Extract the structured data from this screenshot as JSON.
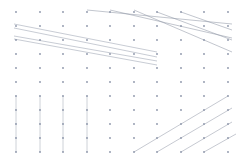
{
  "chart_data": {
    "type": "scatter",
    "title": "",
    "subtitle": "",
    "xlabel": "",
    "ylabel": "",
    "grid": false,
    "legend": null,
    "axis_visible": false,
    "background": "#ffffff",
    "point_color": "#8a93a8",
    "line_color": "#9aa1b0",
    "point_radius": 0.9,
    "line_width": 0.55,
    "xlim": [
      0,
      10
    ],
    "ylim": [
      0,
      11
    ],
    "x_tick_labels": [],
    "y_tick_labels": [],
    "lattice": {
      "columns": 10,
      "rows": 11,
      "x": [
        16,
        40,
        63,
        87,
        110,
        134,
        157,
        181,
        204,
        228
      ],
      "y": [
        12,
        26,
        40,
        54,
        68,
        82,
        96,
        110,
        124,
        138,
        152
      ]
    },
    "points": [
      {
        "x": 16,
        "y": 12
      },
      {
        "x": 40,
        "y": 12
      },
      {
        "x": 63,
        "y": 12
      },
      {
        "x": 87,
        "y": 12
      },
      {
        "x": 110,
        "y": 12
      },
      {
        "x": 134,
        "y": 12
      },
      {
        "x": 157,
        "y": 12
      },
      {
        "x": 181,
        "y": 12
      },
      {
        "x": 204,
        "y": 12
      },
      {
        "x": 228,
        "y": 12
      },
      {
        "x": 16,
        "y": 26
      },
      {
        "x": 40,
        "y": 26
      },
      {
        "x": 63,
        "y": 26
      },
      {
        "x": 87,
        "y": 26
      },
      {
        "x": 110,
        "y": 26
      },
      {
        "x": 134,
        "y": 26
      },
      {
        "x": 157,
        "y": 26
      },
      {
        "x": 181,
        "y": 26
      },
      {
        "x": 204,
        "y": 26
      },
      {
        "x": 228,
        "y": 26
      },
      {
        "x": 16,
        "y": 40
      },
      {
        "x": 40,
        "y": 40
      },
      {
        "x": 63,
        "y": 40
      },
      {
        "x": 87,
        "y": 40
      },
      {
        "x": 110,
        "y": 40
      },
      {
        "x": 134,
        "y": 40
      },
      {
        "x": 157,
        "y": 40
      },
      {
        "x": 181,
        "y": 40
      },
      {
        "x": 204,
        "y": 40
      },
      {
        "x": 228,
        "y": 40
      },
      {
        "x": 16,
        "y": 54
      },
      {
        "x": 40,
        "y": 54
      },
      {
        "x": 63,
        "y": 54
      },
      {
        "x": 87,
        "y": 54
      },
      {
        "x": 110,
        "y": 54
      },
      {
        "x": 134,
        "y": 54
      },
      {
        "x": 157,
        "y": 54
      },
      {
        "x": 181,
        "y": 54
      },
      {
        "x": 204,
        "y": 54
      },
      {
        "x": 228,
        "y": 54
      },
      {
        "x": 16,
        "y": 68
      },
      {
        "x": 40,
        "y": 68
      },
      {
        "x": 63,
        "y": 68
      },
      {
        "x": 87,
        "y": 68
      },
      {
        "x": 110,
        "y": 68
      },
      {
        "x": 134,
        "y": 68
      },
      {
        "x": 157,
        "y": 68
      },
      {
        "x": 181,
        "y": 68
      },
      {
        "x": 204,
        "y": 68
      },
      {
        "x": 228,
        "y": 68
      },
      {
        "x": 16,
        "y": 82
      },
      {
        "x": 40,
        "y": 82
      },
      {
        "x": 63,
        "y": 82
      },
      {
        "x": 87,
        "y": 82
      },
      {
        "x": 110,
        "y": 82
      },
      {
        "x": 134,
        "y": 82
      },
      {
        "x": 157,
        "y": 82
      },
      {
        "x": 181,
        "y": 82
      },
      {
        "x": 204,
        "y": 82
      },
      {
        "x": 228,
        "y": 82
      },
      {
        "x": 16,
        "y": 96
      },
      {
        "x": 40,
        "y": 96
      },
      {
        "x": 63,
        "y": 96
      },
      {
        "x": 87,
        "y": 96
      },
      {
        "x": 110,
        "y": 96
      },
      {
        "x": 134,
        "y": 96
      },
      {
        "x": 157,
        "y": 96
      },
      {
        "x": 181,
        "y": 96
      },
      {
        "x": 204,
        "y": 96
      },
      {
        "x": 228,
        "y": 96
      },
      {
        "x": 16,
        "y": 110
      },
      {
        "x": 40,
        "y": 110
      },
      {
        "x": 63,
        "y": 110
      },
      {
        "x": 87,
        "y": 110
      },
      {
        "x": 110,
        "y": 110
      },
      {
        "x": 134,
        "y": 110
      },
      {
        "x": 157,
        "y": 110
      },
      {
        "x": 181,
        "y": 110
      },
      {
        "x": 204,
        "y": 110
      },
      {
        "x": 228,
        "y": 110
      },
      {
        "x": 16,
        "y": 124
      },
      {
        "x": 40,
        "y": 124
      },
      {
        "x": 63,
        "y": 124
      },
      {
        "x": 87,
        "y": 124
      },
      {
        "x": 110,
        "y": 124
      },
      {
        "x": 134,
        "y": 124
      },
      {
        "x": 157,
        "y": 124
      },
      {
        "x": 181,
        "y": 124
      },
      {
        "x": 204,
        "y": 124
      },
      {
        "x": 228,
        "y": 124
      },
      {
        "x": 16,
        "y": 138
      },
      {
        "x": 40,
        "y": 138
      },
      {
        "x": 63,
        "y": 138
      },
      {
        "x": 87,
        "y": 138
      },
      {
        "x": 110,
        "y": 138
      },
      {
        "x": 134,
        "y": 138
      },
      {
        "x": 157,
        "y": 138
      },
      {
        "x": 181,
        "y": 138
      },
      {
        "x": 204,
        "y": 138
      },
      {
        "x": 228,
        "y": 138
      },
      {
        "x": 16,
        "y": 152
      },
      {
        "x": 40,
        "y": 152
      },
      {
        "x": 63,
        "y": 152
      },
      {
        "x": 87,
        "y": 152
      },
      {
        "x": 110,
        "y": 152
      },
      {
        "x": 134,
        "y": 152
      },
      {
        "x": 157,
        "y": 152
      },
      {
        "x": 181,
        "y": 152
      },
      {
        "x": 204,
        "y": 152
      },
      {
        "x": 228,
        "y": 152
      }
    ],
    "segment_groups": [
      {
        "name": "upper-left-shallow-descending",
        "orientation": "descending-shallow",
        "count": 4,
        "segments": [
          {
            "x1": 14,
            "y1": 24,
            "x2": 157,
            "y2": 52
          },
          {
            "x1": 14,
            "y1": 28,
            "x2": 157,
            "y2": 57
          },
          {
            "x1": 14,
            "y1": 36,
            "x2": 157,
            "y2": 61
          },
          {
            "x1": 14,
            "y1": 39,
            "x2": 157,
            "y2": 65
          }
        ]
      },
      {
        "name": "upper-right-steep-descending",
        "orientation": "descending-steep",
        "count": 5,
        "segments": [
          {
            "x1": 87,
            "y1": 10,
            "x2": 232,
            "y2": 24
          },
          {
            "x1": 110,
            "y1": 10,
            "x2": 232,
            "y2": 38
          },
          {
            "x1": 134,
            "y1": 10,
            "x2": 232,
            "y2": 52
          },
          {
            "x1": 157,
            "y1": 12,
            "x2": 232,
            "y2": 40
          },
          {
            "x1": 181,
            "y1": 12,
            "x2": 232,
            "y2": 30
          }
        ]
      },
      {
        "name": "lower-left-vertical",
        "orientation": "vertical",
        "count": 4,
        "segments": [
          {
            "x1": 16,
            "y1": 96,
            "x2": 16,
            "y2": 152
          },
          {
            "x1": 40,
            "y1": 96,
            "x2": 40,
            "y2": 152
          },
          {
            "x1": 63,
            "y1": 96,
            "x2": 63,
            "y2": 152
          },
          {
            "x1": 87,
            "y1": 96,
            "x2": 87,
            "y2": 152
          }
        ]
      },
      {
        "name": "lower-right-ascending",
        "orientation": "ascending",
        "count": 4,
        "segments": [
          {
            "x1": 134,
            "y1": 152,
            "x2": 228,
            "y2": 96
          },
          {
            "x1": 157,
            "y1": 152,
            "x2": 232,
            "y2": 108
          },
          {
            "x1": 181,
            "y1": 152,
            "x2": 232,
            "y2": 122
          },
          {
            "x1": 204,
            "y1": 152,
            "x2": 236,
            "y2": 134
          }
        ]
      }
    ]
  }
}
